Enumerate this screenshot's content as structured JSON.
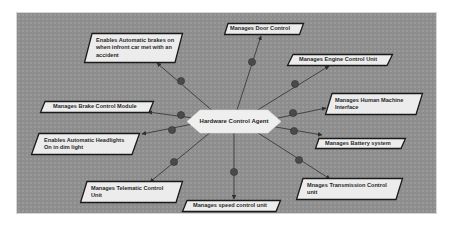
{
  "diagram": {
    "type": "agent-responsibility-diagram",
    "colors": {
      "canvas": "#8d8d8d",
      "node_fill": "#ececec",
      "node_border": "#1a1a1a",
      "edge": "#3a3a3a",
      "edge_dot": "#4a4a4a"
    },
    "center": {
      "id": "agent",
      "label": "Hardware Control Agent",
      "shape": "hexagon"
    },
    "nodes": [
      {
        "id": "n1",
        "label": "Enables Automatic brakes on\nwhen infront car met with an\naccident",
        "shape": "parallelogram"
      },
      {
        "id": "n2",
        "label": "Manages Door Control",
        "shape": "parallelogram"
      },
      {
        "id": "n3",
        "label": "Manages Engine Control Unit",
        "shape": "parallelogram"
      },
      {
        "id": "n4",
        "label": "Manages Human Machine\nInterface",
        "shape": "parallelogram"
      },
      {
        "id": "n5",
        "label": "Manages Brake Control Module",
        "shape": "parallelogram"
      },
      {
        "id": "n6",
        "label": "Enables Automatic Headlights\nOn in dim light",
        "shape": "parallelogram"
      },
      {
        "id": "n7",
        "label": "Manages Battery system",
        "shape": "parallelogram"
      },
      {
        "id": "n8",
        "label": "Manages Telematic Control\nUnit",
        "shape": "parallelogram"
      },
      {
        "id": "n9",
        "label": "Mnages Transmission Control\nunit",
        "shape": "parallelogram"
      },
      {
        "id": "n10",
        "label": "Manages speed control unit",
        "shape": "parallelogram"
      }
    ],
    "edges": [
      {
        "from": "agent",
        "to": "n1"
      },
      {
        "from": "agent",
        "to": "n2"
      },
      {
        "from": "agent",
        "to": "n3"
      },
      {
        "from": "agent",
        "to": "n4"
      },
      {
        "from": "agent",
        "to": "n5"
      },
      {
        "from": "agent",
        "to": "n6"
      },
      {
        "from": "agent",
        "to": "n7"
      },
      {
        "from": "agent",
        "to": "n8"
      },
      {
        "from": "agent",
        "to": "n9"
      },
      {
        "from": "agent",
        "to": "n10"
      }
    ]
  }
}
